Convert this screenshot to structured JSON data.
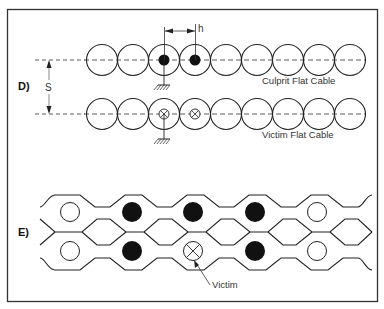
{
  "panels": [
    {
      "id": "D",
      "label": "D)",
      "dimension_s": "S",
      "dimension_h": "h",
      "culprit_label": "Culprit Flat Cable",
      "victim_label": "Victim Flat Cable",
      "conductor_count": 9,
      "culprit_active": [
        2,
        3
      ],
      "victim_active": [
        2,
        3
      ],
      "grounded_index": 2
    },
    {
      "id": "E",
      "label": "E)",
      "victim_label": "Victim",
      "top_row": [
        "open",
        "filled",
        "filled",
        "filled",
        "open"
      ],
      "bottom_row": [
        "open",
        "filled",
        "victim",
        "filled",
        "open"
      ]
    }
  ]
}
